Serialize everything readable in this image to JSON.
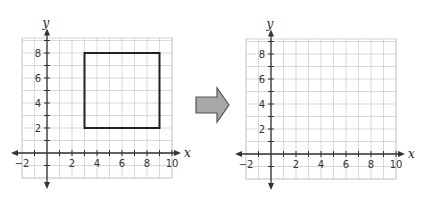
{
  "figure": {
    "colors": {
      "grid": "#cfcfcf",
      "axis": "#333333",
      "shape": "#222222",
      "arrow_fill": "#a8a8a8",
      "arrow_stroke": "#555555"
    }
  },
  "left_plane": {
    "x_axis_label": "x",
    "y_axis_label": "y",
    "x_range": [
      -2,
      10
    ],
    "y_range": [
      -2,
      9
    ],
    "x_tick_labels": [
      "−2",
      "2",
      "4",
      "6",
      "8",
      "10"
    ],
    "y_tick_labels": [
      "2",
      "4",
      "6",
      "8"
    ],
    "shape": {
      "type": "square",
      "vertices": [
        [
          3,
          2
        ],
        [
          9,
          2
        ],
        [
          9,
          8
        ],
        [
          3,
          8
        ]
      ]
    }
  },
  "arrow": {
    "direction": "right"
  },
  "right_plane": {
    "x_axis_label": "x",
    "y_axis_label": "y",
    "x_range": [
      -2,
      10
    ],
    "y_range": [
      -2,
      9
    ],
    "x_tick_labels": [
      "−2",
      "2",
      "4",
      "6",
      "8",
      "10"
    ],
    "y_tick_labels": [
      "2",
      "4",
      "6",
      "8"
    ],
    "shape": null
  }
}
